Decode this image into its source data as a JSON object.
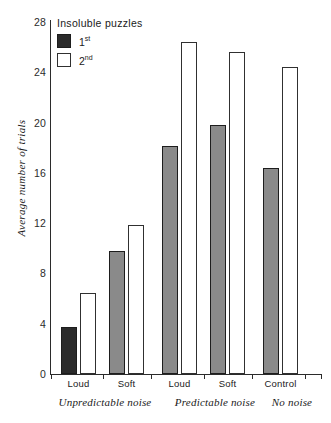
{
  "chart_data": {
    "type": "bar",
    "title": "",
    "xlabel": "",
    "ylabel": "Average number of trials",
    "ylim": [
      0,
      28
    ],
    "yticks": [
      0,
      4,
      8,
      12,
      16,
      20,
      24,
      28
    ],
    "grid": false,
    "legend_position": "top-left",
    "legend_title": "Insoluble puzzles",
    "categories": [
      "Loud",
      "Soft",
      "Loud",
      "Soft",
      "Control"
    ],
    "group_labels": [
      "Unpredictable noise",
      "Predictable noise",
      "No noise"
    ],
    "series": [
      {
        "name": "1st",
        "values": [
          3.7,
          9.7,
          18.0,
          19.7,
          16.3
        ]
      },
      {
        "name": "2nd",
        "values": [
          6.4,
          11.8,
          26.3,
          25.5,
          24.3
        ]
      }
    ]
  },
  "legend": {
    "title": "Insoluble puzzles",
    "items": [
      {
        "label": "1",
        "sup": "st",
        "swatch": "dark-filled-square"
      },
      {
        "label": "2",
        "sup": "nd",
        "swatch": "white-outlined-square"
      }
    ]
  },
  "axes": {
    "y_title": "Average number of trials",
    "y_ticks": [
      "0",
      "4",
      "8",
      "12",
      "16",
      "20",
      "24",
      "28"
    ],
    "x_ticks": [
      "Loud",
      "Soft",
      "Loud",
      "Soft",
      "Control"
    ],
    "x_groups": [
      "Unpredictable noise",
      "Predictable noise",
      "No noise"
    ]
  },
  "colors": {
    "bar_first_dark": "#2b2b2b",
    "bar_first_gray": "#8a8a8a",
    "bar_second": "#ffffff",
    "axis": "#2b2b2b",
    "text": "#1a1a1a"
  }
}
